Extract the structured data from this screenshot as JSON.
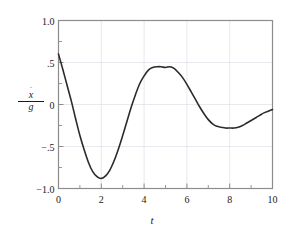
{
  "figure": {
    "background": "#ffffff",
    "frame_color": "#8c8c8c",
    "grid_color": "#e2e2ea",
    "curve_color": "#2b2b2b",
    "axis_text_color": "#1a1a1a"
  },
  "axis_labels": {
    "y_numerator": "x",
    "y_numerator_accent": "¨",
    "y_denominator": "g",
    "x": "t"
  },
  "chart_data": {
    "type": "line",
    "title": "",
    "subtitle": "",
    "xlabel": "t",
    "ylabel": "ẍ/g",
    "xlim": [
      0,
      10
    ],
    "ylim": [
      -1.0,
      1.0
    ],
    "grid": true,
    "legend": null,
    "xticks": [
      0,
      2,
      4,
      6,
      8,
      10
    ],
    "xticklabels": [
      "0",
      "2",
      "4",
      "6",
      "8",
      "10"
    ],
    "x_minor_ticks": [
      1,
      3,
      5,
      7,
      9
    ],
    "yticks": [
      1.0,
      0.5,
      0.0,
      -0.5,
      -1.0
    ],
    "yticklabels": [
      "1.0",
      ".5",
      "0",
      "−.5",
      "−1.0"
    ],
    "y_minor_ticks": [
      0.75,
      0.25,
      -0.25,
      -0.75
    ],
    "annotations": [],
    "series": [
      {
        "name": "ẍ/g",
        "color": "#2b2b2b",
        "linewidth": 1.6,
        "x": [
          0.0,
          0.2,
          0.4,
          0.6,
          0.8,
          1.0,
          1.2,
          1.4,
          1.6,
          1.8,
          2.0,
          2.2,
          2.4,
          2.6,
          2.8,
          3.0,
          3.2,
          3.4,
          3.6,
          3.8,
          4.0,
          4.2,
          4.4,
          4.6,
          4.8,
          5.0,
          5.2,
          5.4,
          5.6,
          5.8,
          6.0,
          6.2,
          6.4,
          6.6,
          6.8,
          7.0,
          7.2,
          7.4,
          7.6,
          7.8,
          8.0,
          8.2,
          8.4,
          8.6,
          8.8,
          9.0,
          9.2,
          9.4,
          9.6,
          9.8,
          10.0
        ],
        "y": [
          0.6,
          0.42,
          0.23,
          0.04,
          -0.17,
          -0.37,
          -0.54,
          -0.69,
          -0.8,
          -0.86,
          -0.88,
          -0.85,
          -0.78,
          -0.67,
          -0.53,
          -0.37,
          -0.2,
          -0.03,
          0.12,
          0.25,
          0.34,
          0.41,
          0.44,
          0.45,
          0.45,
          0.44,
          0.45,
          0.43,
          0.38,
          0.32,
          0.24,
          0.15,
          0.06,
          -0.03,
          -0.11,
          -0.18,
          -0.23,
          -0.26,
          -0.27,
          -0.28,
          -0.28,
          -0.28,
          -0.27,
          -0.25,
          -0.22,
          -0.19,
          -0.16,
          -0.13,
          -0.1,
          -0.08,
          -0.06
        ]
      }
    ],
    "key_points": [
      {
        "label": "start",
        "t": 0.0,
        "value": 0.6
      },
      {
        "label": "first-minimum",
        "t": 1.95,
        "value": -0.88
      },
      {
        "label": "first-maximum",
        "t": 5.05,
        "value": 0.45
      },
      {
        "label": "second-minimum",
        "t": 8.2,
        "value": -0.28
      },
      {
        "label": "end",
        "t": 10.0,
        "value": -0.06
      }
    ]
  }
}
